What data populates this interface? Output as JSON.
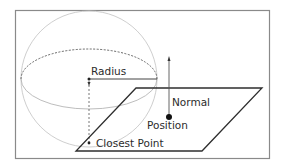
{
  "diagram": {
    "type": "sphere-plane-closest-point",
    "labels": {
      "radius": "Radius",
      "normal": "Normal",
      "position": "Position",
      "closest_point": "Closest Point"
    },
    "colors": {
      "frame": "#8a8a8a",
      "sphere": "#c8c8c8",
      "equator_back": "#555555",
      "plane": "#2e2e2e",
      "text": "#2b2b2b"
    }
  }
}
